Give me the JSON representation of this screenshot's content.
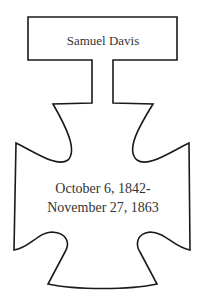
{
  "nameplate": {
    "name": "Samuel Davis"
  },
  "cross": {
    "date_line_1": "October 6, 1842-",
    "date_line_2": "November 27, 1863"
  },
  "colors": {
    "outline": "#1a1a1a",
    "text": "#333333",
    "background": "#ffffff"
  }
}
